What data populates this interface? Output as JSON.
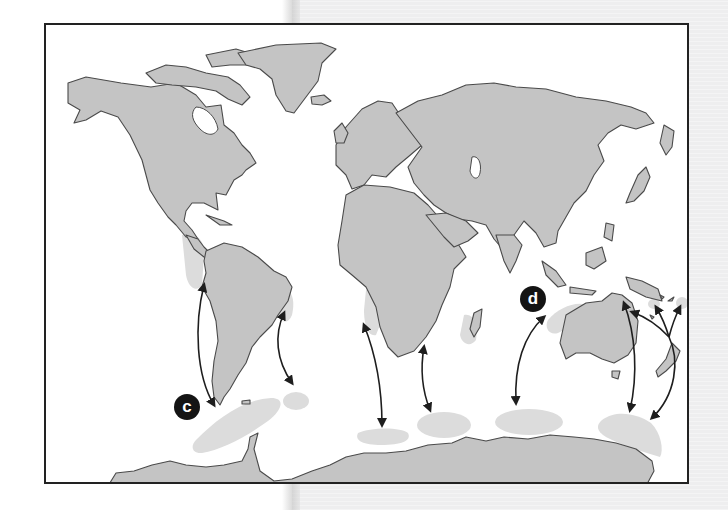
{
  "figure": {
    "type": "world-map-migration-diagram",
    "labels": [
      {
        "id": "c",
        "text": "c"
      },
      {
        "id": "d",
        "text": "d"
      }
    ],
    "colors": {
      "land": "#c4c4c4",
      "coastline": "#4a4a4a",
      "feeding_grounds": "#dcdcdc",
      "arrows": "#1e1e1e",
      "frame": "#222222",
      "label_badge": "#141414"
    },
    "continents": [
      "North America",
      "Greenland",
      "South America",
      "Europe",
      "Africa",
      "Asia",
      "Australia",
      "New Zealand",
      "Antarctica",
      "Madagascar"
    ],
    "breeding_areas": [
      "West coast South America",
      "East coast Brazil",
      "West Africa",
      "East Africa / Mozambique",
      "Western Australia",
      "Eastern Australia",
      "South Pacific islands"
    ],
    "feeding_areas": [
      "Antarctic Peninsula (c)",
      "South Georgia",
      "South Atlantic Antarctic",
      "Indian Ocean Antarctic",
      "South of Australia",
      "Ross Sea region"
    ],
    "arrow_count": 9
  }
}
